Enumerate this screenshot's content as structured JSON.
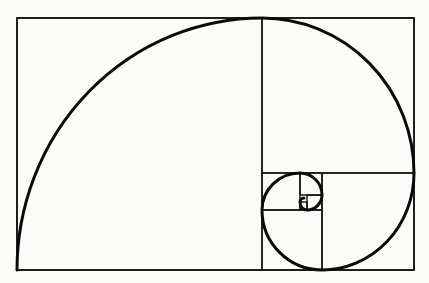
{
  "diagram": {
    "colors": {
      "background": "#fbfbfa",
      "stroke": "#111111"
    },
    "outer_rect": {
      "x": 17,
      "y": 18,
      "w": 397,
      "h": 252
    },
    "squares": [
      {
        "name": "square-1",
        "x": 17,
        "y": 18,
        "w": 245,
        "h": 252
      },
      {
        "name": "square-2",
        "x": 262,
        "y": 18,
        "w": 152,
        "h": 155
      },
      {
        "name": "square-3",
        "x": 322,
        "y": 173,
        "w": 92,
        "h": 97
      },
      {
        "name": "square-4",
        "x": 262,
        "y": 210,
        "w": 60,
        "h": 60
      },
      {
        "name": "square-5",
        "x": 262,
        "y": 173,
        "w": 38,
        "h": 37
      },
      {
        "name": "square-6",
        "x": 300,
        "y": 173,
        "w": 22,
        "h": 22
      },
      {
        "name": "square-7",
        "x": 307,
        "y": 195,
        "w": 15,
        "h": 15
      },
      {
        "name": "square-8",
        "x": 300,
        "y": 202,
        "w": 7,
        "h": 8
      }
    ],
    "spiral_path": "M17,270 A245,252 0 0 1 262,18 A152,155 0 0 1 414,173 A92,97 0 0 1 322,270 A60,60 0 0 1 262,210 A38,37 0 0 1 300,173 A22,22 0 0 1 322,195 A15,15 0 0 1 307,210 A7,8 0 0 1 300,202 A4,4 0 0 1 304,198"
  }
}
